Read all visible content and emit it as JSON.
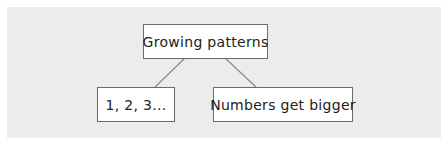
{
  "diagram": {
    "type": "tree",
    "root": {
      "label": "Growing patterns"
    },
    "children": [
      {
        "label": "1, 2, 3..."
      },
      {
        "label": "Numbers get bigger"
      }
    ],
    "colors": {
      "background_panel": "#ececec",
      "node_fill": "#ffffff",
      "node_border": "#6a6a6a",
      "edge": "#8a8a8a"
    }
  }
}
